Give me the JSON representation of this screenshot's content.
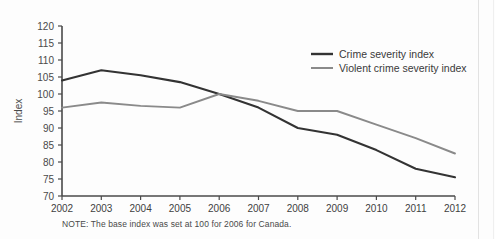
{
  "chart_data": {
    "type": "line",
    "title": "",
    "xlabel": "",
    "ylabel": "Index",
    "categories": [
      "2002",
      "2003",
      "2004",
      "2005",
      "2006",
      "2007",
      "2008",
      "2009",
      "2010",
      "2011",
      "2012"
    ],
    "x": [
      2002,
      2003,
      2004,
      2005,
      2006,
      2007,
      2008,
      2009,
      2010,
      2011,
      2012
    ],
    "ylim": [
      70,
      120
    ],
    "yticks": [
      70,
      75,
      80,
      85,
      90,
      95,
      100,
      105,
      110,
      115,
      120
    ],
    "grid": false,
    "legend_position": "top-right",
    "series": [
      {
        "name": "Crime severity index",
        "color": "#333333",
        "values": [
          104,
          107,
          105.5,
          103.5,
          100,
          96,
          90,
          88,
          83.5,
          78,
          75.5
        ]
      },
      {
        "name": "Violent crime severity index",
        "color": "#8a8a8a",
        "values": [
          96,
          97.5,
          96.5,
          96,
          100,
          98,
          95,
          95,
          91,
          87,
          82.5
        ]
      }
    ],
    "note": "NOTE: The base index was set at 100 for 2006 for Canada."
  },
  "legend": {
    "items": [
      {
        "label": "Crime severity index",
        "color": "#333333"
      },
      {
        "label": "Violent crime severity index",
        "color": "#8a8a8a"
      }
    ]
  },
  "axes": {
    "y_title": "Index",
    "y_tick_labels": [
      "120",
      "115",
      "110",
      "105",
      "100",
      "95",
      "90",
      "85",
      "80",
      "75",
      "70"
    ],
    "x_tick_labels": [
      "2002",
      "2003",
      "2004",
      "2005",
      "2006",
      "2007",
      "2008",
      "2009",
      "2010",
      "2011",
      "2012"
    ]
  },
  "note": {
    "text": "NOTE: The base index was set at 100 for 2006 for Canada."
  },
  "colors": {
    "series_dark": "#333333",
    "series_gray": "#8a8a8a",
    "axis": "#4a4a4a",
    "background": "#fdfdfd"
  }
}
